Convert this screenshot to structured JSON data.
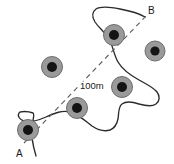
{
  "figure": {
    "type": "survey-sketch-diagram",
    "background_color": "#ffffff",
    "outline_color": "#2b2b2b",
    "baseline_color": "#5e5e5e",
    "marker_ring_color": "#9a9a9a",
    "marker_core_color": "#141414"
  },
  "labels": {
    "point_a": "A",
    "point_b": "B",
    "scale": "100m"
  },
  "markers": [
    {
      "id": "marker-1",
      "cx": 28,
      "cy": 130,
      "r_ring": 10.5,
      "r_core": 5.0
    },
    {
      "id": "marker-2",
      "cx": 77,
      "cy": 108,
      "r_ring": 10.5,
      "r_core": 5.0
    },
    {
      "id": "marker-3",
      "cx": 52,
      "cy": 67,
      "r_ring": 10.5,
      "r_core": 5.0
    },
    {
      "id": "marker-4",
      "cx": 122,
      "cy": 87,
      "r_ring": 10.5,
      "r_core": 5.0
    },
    {
      "id": "marker-5",
      "cx": 114,
      "cy": 35,
      "r_ring": 10.5,
      "r_core": 5.0
    },
    {
      "id": "marker-6",
      "cx": 155,
      "cy": 51,
      "r_ring": 10.0,
      "r_core": 4.6
    }
  ],
  "baseline": {
    "from": {
      "x": 24,
      "y": 143
    },
    "to": {
      "x": 146,
      "y": 16
    },
    "dash": "5 4"
  },
  "label_positions": {
    "point_a": {
      "x": 16,
      "y": 157
    },
    "point_b": {
      "x": 148,
      "y": 14
    },
    "scale": {
      "x": 80,
      "y": 89
    }
  },
  "boundary_path": "M 36 156 C 33 146 31 134 32 126 C 33 118 35 114 33 113 C 28 111 20 111 19 113 C 17 116 20 120 24 121 C 30 123 39 120 46 117 C 55 113 62 110 70 112 C 78 114 84 120 92 126 C 98 130 104 132 110 130 C 115 128 117 124 118 119 C 119 113 118 107 122 104 C 126 101 133 102 139 104 C 146 106 152 107 156 104 C 160 101 160 96 157 92 C 153 87 146 84 139 80 C 130 75 122 69 118 62 C 114 55 113 47 110 41 C 106 33 99 28 95 22 C 92 17 92 12 96 9 C 101 6 110 7 120 9 C 131 11 140 14 145 17"
}
